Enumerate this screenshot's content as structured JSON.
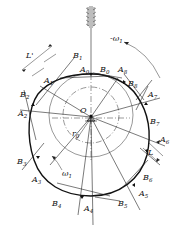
{
  "diagram": {
    "type": "cam-profile-construction",
    "center_label": "O",
    "base_circle_radius_label": "r0",
    "rotation_labels": {
      "cam": "ω1",
      "reverse": "-ω1"
    },
    "length_label": "L'",
    "contact_points_A": [
      "A0",
      "A1",
      "A2",
      "A3",
      "A4",
      "A5",
      "A6",
      "A7",
      "A8"
    ],
    "tangent_points_B": [
      "B0",
      "B1",
      "B2",
      "B3",
      "B4",
      "B5",
      "B6",
      "B7",
      "B8"
    ],
    "colors": {
      "line": "#222222",
      "profile": "#111111",
      "background": "#ffffff"
    }
  },
  "labels": {
    "O": "O",
    "r0": "r",
    "r0_sub": "0",
    "w1": "ω",
    "w1_sub": "1",
    "neg_w1": "-ω",
    "neg_w1_sub": "1",
    "L1": "L'",
    "L2": "L",
    "A": "A",
    "B": "B",
    "sub0": "0",
    "sub1": "1",
    "sub2": "2",
    "sub3": "3",
    "sub4": "4",
    "sub5": "5",
    "sub6": "6",
    "sub7": "7",
    "sub8": "8"
  }
}
